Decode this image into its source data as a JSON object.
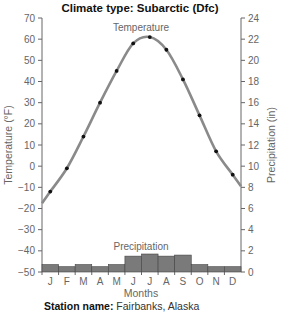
{
  "chart_data": {
    "type": "bar+line",
    "title": "Climate type: Subarctic (Dfc)",
    "xlabel": "Months",
    "ylabel_left": "Temperature (°F)",
    "ylabel_right": "Precipitation (in)",
    "categories": [
      "J",
      "F",
      "M",
      "A",
      "M",
      "J",
      "J",
      "A",
      "S",
      "O",
      "N",
      "D"
    ],
    "series": [
      {
        "name": "Temperature",
        "type": "line",
        "axis": "left",
        "values": [
          -12,
          -1,
          14,
          30,
          45,
          58,
          61,
          55,
          41,
          24,
          7,
          -4
        ]
      },
      {
        "name": "Precipitation",
        "type": "bar",
        "axis": "right",
        "values": [
          0.7,
          0.5,
          0.7,
          0.5,
          0.7,
          1.5,
          1.7,
          1.5,
          1.6,
          0.7,
          0.5,
          0.5
        ]
      }
    ],
    "ylim_left": [
      -50,
      70
    ],
    "yticks_left": [
      70,
      60,
      50,
      40,
      30,
      20,
      10,
      0,
      -10,
      -20,
      -30,
      -40,
      -50
    ],
    "ylim_right": [
      0,
      24
    ],
    "yticks_right": [
      24,
      22,
      20,
      18,
      16,
      14,
      12,
      10,
      8,
      6,
      4,
      2,
      0
    ],
    "grid": false,
    "legend": "inline labels"
  },
  "station": {
    "label": "Station name:",
    "value": "Fairbanks, Alaska"
  },
  "colors": {
    "line": "#8a8a8a",
    "bar": "#7a7a7a",
    "bar_edge": "#444444",
    "point": "#111111",
    "axis": "#666666"
  }
}
